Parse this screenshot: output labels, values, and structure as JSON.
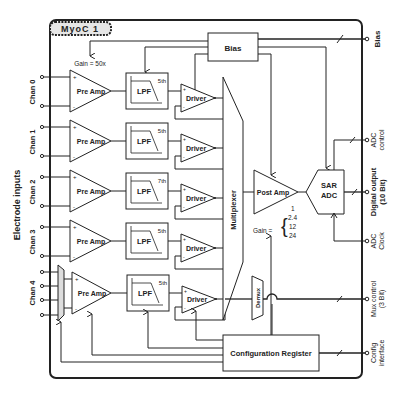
{
  "title": "MyoC 1",
  "left_label": "Electrode inputs",
  "channels": [
    {
      "label": "Chan 0",
      "preamp": "Pre Amp",
      "lpf": "LPF",
      "order": "5th",
      "driver": "Driver"
    },
    {
      "label": "Chan 1",
      "preamp": "Pre Amp",
      "lpf": "LPF",
      "order": "5th",
      "driver": "Driver"
    },
    {
      "label": "Chan 2",
      "preamp": "Pre Amp",
      "lpf": "LPF",
      "order": "7th",
      "driver": "Driver"
    },
    {
      "label": "Chan 3",
      "preamp": "Pre Amp",
      "lpf": "LPF",
      "order": "5th",
      "driver": "Driver"
    },
    {
      "label": "Chan 4",
      "preamp": "Pre Amp",
      "lpf": "LPF",
      "order": "5th",
      "driver": "Driver"
    }
  ],
  "preamp_gain": "Gain = 50x",
  "bias_label": "Bias",
  "multiplexer_label": "Multiplexer",
  "demux_label": "Demux",
  "postamp": {
    "label": "Post Amp",
    "gain_prefix": "Gain =",
    "gains": [
      "1",
      "2.4",
      "12",
      "24"
    ]
  },
  "adc": {
    "line1": "SAR",
    "line2": "ADC"
  },
  "config_register": "Configuration Register",
  "outputs": [
    {
      "line1": "Bias",
      "line2": ""
    },
    {
      "line1": "ADC",
      "line2": "control"
    },
    {
      "line1": "Digital output",
      "line2": "(10 Bit)"
    },
    {
      "line1": "ADC",
      "line2": "Clock"
    },
    {
      "line1": "Mux control",
      "line2": "(3 Bit)"
    },
    {
      "line1": "Config",
      "line2": "interface"
    }
  ],
  "pin_plus": "+",
  "pin_minus": "-"
}
